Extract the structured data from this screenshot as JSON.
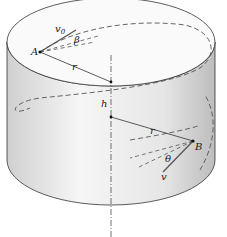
{
  "diagram": {
    "labels": {
      "point_a": "A",
      "point_b": "B",
      "velocity_initial": "v",
      "velocity_initial_sub": "0",
      "velocity": "v",
      "angle_beta": "β",
      "angle_theta": "θ",
      "radius_top": "r",
      "radius_bottom": "r",
      "height": "h"
    },
    "colors": {
      "outline": "#333333",
      "dashed": "#555555",
      "surface_light": "#f4f4f4",
      "surface_dark": "#c8c8c8"
    }
  }
}
